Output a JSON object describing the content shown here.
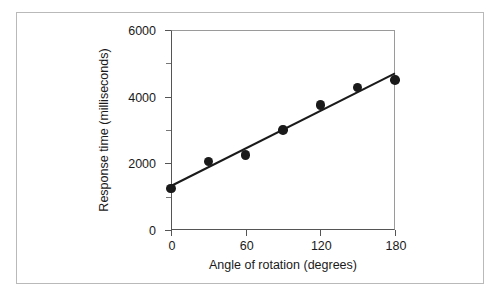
{
  "figure": {
    "background_color": "#ffffff",
    "border_color": "#b9b9b9",
    "axis_color": "#555555",
    "marker_color": "#1a1a1a",
    "line_color": "#1a1a1a"
  },
  "chart_data": {
    "type": "scatter",
    "title": "",
    "subtitle": "",
    "xlabel": "Angle of rotation (degrees)",
    "ylabel": "Response time (milliseconds)",
    "xlim": [
      0,
      180
    ],
    "ylim": [
      0,
      6000
    ],
    "grid": false,
    "legend": null,
    "x_ticks": [
      0,
      60,
      120,
      180
    ],
    "x_tick_labels": [
      "0",
      "60",
      "120",
      "180"
    ],
    "y_ticks_major": [
      0,
      2000,
      4000,
      6000
    ],
    "y_tick_labels": [
      "0",
      "2000",
      "4000",
      "6000"
    ],
    "y_ticks_minor": [
      1000,
      3000,
      5000
    ],
    "x": [
      0,
      30,
      60,
      90,
      120,
      150,
      180
    ],
    "y": [
      1250,
      2050,
      2250,
      3000,
      3750,
      4270,
      4500
    ],
    "series": [
      {
        "name": "Response time",
        "marker": "filled-circle",
        "points": [
          {
            "x": 0,
            "y": 1250
          },
          {
            "x": 30,
            "y": 2050
          },
          {
            "x": 60,
            "y": 2250
          },
          {
            "x": 90,
            "y": 3000
          },
          {
            "x": 120,
            "y": 3750
          },
          {
            "x": 150,
            "y": 4270
          },
          {
            "x": 180,
            "y": 4500
          }
        ]
      }
    ],
    "fit_line": {
      "name": "linear regression",
      "x_start": 0,
      "y_start": 1320,
      "x_end": 180,
      "y_end": 4700
    },
    "annotations": []
  }
}
